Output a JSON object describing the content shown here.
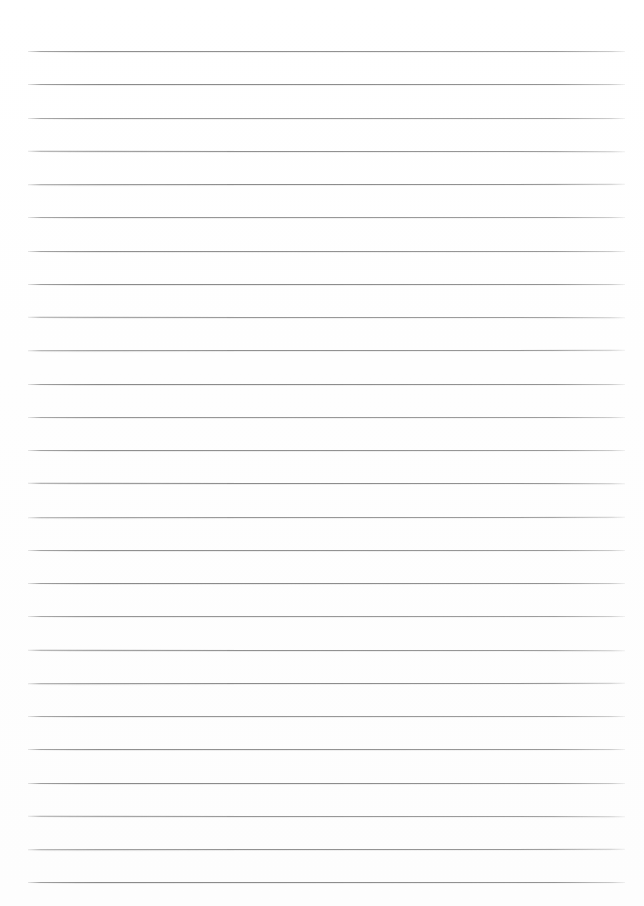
{
  "page": {
    "kind": "lined-paper-sheet",
    "width_px": 644,
    "height_px": 906,
    "background_color": "#fefefe",
    "has_text_content": false,
    "has_header": false,
    "has_margin_rule": false,
    "written_content": ""
  },
  "ruling": {
    "line_color": "#808080",
    "line_thickness_px": 1,
    "line_count": 26,
    "first_line_y_px": 51,
    "line_spacing_px": 33.2,
    "line_left_x_px": 28,
    "line_right_x_px": 625,
    "line_length_px": 597,
    "top_margin_px": 51,
    "left_margin_px": 28,
    "right_margin_px": 19,
    "bottom_margin_px": 25,
    "style": "wide-ruled horizontal lines, no vertical margin line"
  },
  "lines": [
    {
      "index": 1,
      "y": 51
    },
    {
      "index": 2,
      "y": 84
    },
    {
      "index": 3,
      "y": 118
    },
    {
      "index": 4,
      "y": 151
    },
    {
      "index": 5,
      "y": 184
    },
    {
      "index": 6,
      "y": 217
    },
    {
      "index": 7,
      "y": 251
    },
    {
      "index": 8,
      "y": 284
    },
    {
      "index": 9,
      "y": 317
    },
    {
      "index": 10,
      "y": 350
    },
    {
      "index": 11,
      "y": 384
    },
    {
      "index": 12,
      "y": 417
    },
    {
      "index": 13,
      "y": 450
    },
    {
      "index": 14,
      "y": 483
    },
    {
      "index": 15,
      "y": 517
    },
    {
      "index": 16,
      "y": 550
    },
    {
      "index": 17,
      "y": 583
    },
    {
      "index": 18,
      "y": 616
    },
    {
      "index": 19,
      "y": 650
    },
    {
      "index": 20,
      "y": 683
    },
    {
      "index": 21,
      "y": 716
    },
    {
      "index": 22,
      "y": 749
    },
    {
      "index": 23,
      "y": 783
    },
    {
      "index": 24,
      "y": 816
    },
    {
      "index": 25,
      "y": 849
    },
    {
      "index": 26,
      "y": 882
    }
  ]
}
